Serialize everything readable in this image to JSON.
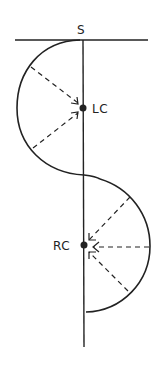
{
  "diagram": {
    "labels": {
      "start": "S",
      "left_center": "LC",
      "right_center": "RC"
    },
    "colors": {
      "stroke": "#222222",
      "background": "#ffffff"
    }
  }
}
